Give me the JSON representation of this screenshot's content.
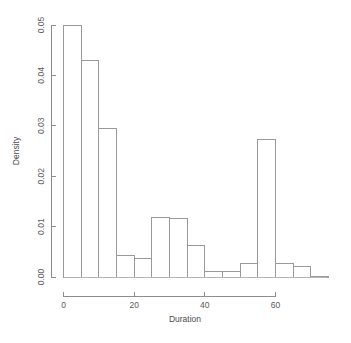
{
  "chart_data": {
    "type": "bar",
    "title": "",
    "subtitle": "",
    "xlabel": "Duration",
    "ylabel": "Density",
    "xlim": [
      0,
      75
    ],
    "ylim": [
      0,
      0.05
    ],
    "grid": false,
    "legend": null,
    "bin_width": 5,
    "bin_edges": [
      0,
      5,
      10,
      15,
      20,
      25,
      30,
      35,
      40,
      45,
      50,
      55,
      60,
      65,
      70,
      75
    ],
    "categories": [
      "0-5",
      "5-10",
      "10-15",
      "15-20",
      "20-25",
      "25-30",
      "30-35",
      "35-40",
      "40-45",
      "45-50",
      "50-55",
      "55-60",
      "60-65",
      "65-70",
      "70-75"
    ],
    "values": [
      0.05,
      0.0429,
      0.0295,
      0.0042,
      0.0036,
      0.0119,
      0.0117,
      0.0062,
      0.001,
      0.001,
      0.0026,
      0.0273,
      0.0026,
      0.002,
      0.0
    ],
    "x_ticks": [
      0,
      20,
      40,
      60
    ],
    "x_tick_labels": [
      "0",
      "20",
      "40",
      "60"
    ],
    "y_ticks": [
      0.0,
      0.01,
      0.02,
      0.03,
      0.04,
      0.05
    ],
    "y_tick_labels": [
      "0.00",
      "0.01",
      "0.02",
      "0.03",
      "0.04",
      "0.05"
    ],
    "colors": {
      "bar_fill": "#ffffff",
      "bar_stroke": "#9a9a9a",
      "axis": "#8d8d8d",
      "text": "#4a4a4a",
      "background": "#ffffff"
    }
  },
  "labels": {
    "x_axis_title": "Duration",
    "y_axis_title": "Density"
  }
}
